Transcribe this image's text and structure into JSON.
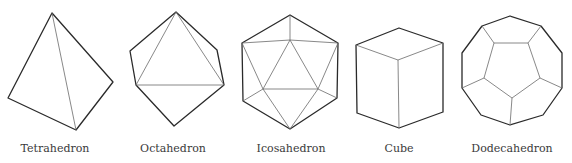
{
  "figure": {
    "shapes": [
      {
        "id": "tetrahedron",
        "label": "Tetrahedron",
        "label_x": 55
      },
      {
        "id": "octahedron",
        "label": "Octahedron",
        "label_x": 173
      },
      {
        "id": "icosahedron",
        "label": "Icosahedron",
        "label_x": 291
      },
      {
        "id": "cube",
        "label": "Cube",
        "label_x": 399
      },
      {
        "id": "dodecahedron",
        "label": "Dodecahedron",
        "label_x": 512
      }
    ],
    "colors": {
      "outline": "#2a2a2a",
      "hidden_edge": "#6a6a6a",
      "background": "#ffffff",
      "text": "#3a3a3a"
    }
  }
}
